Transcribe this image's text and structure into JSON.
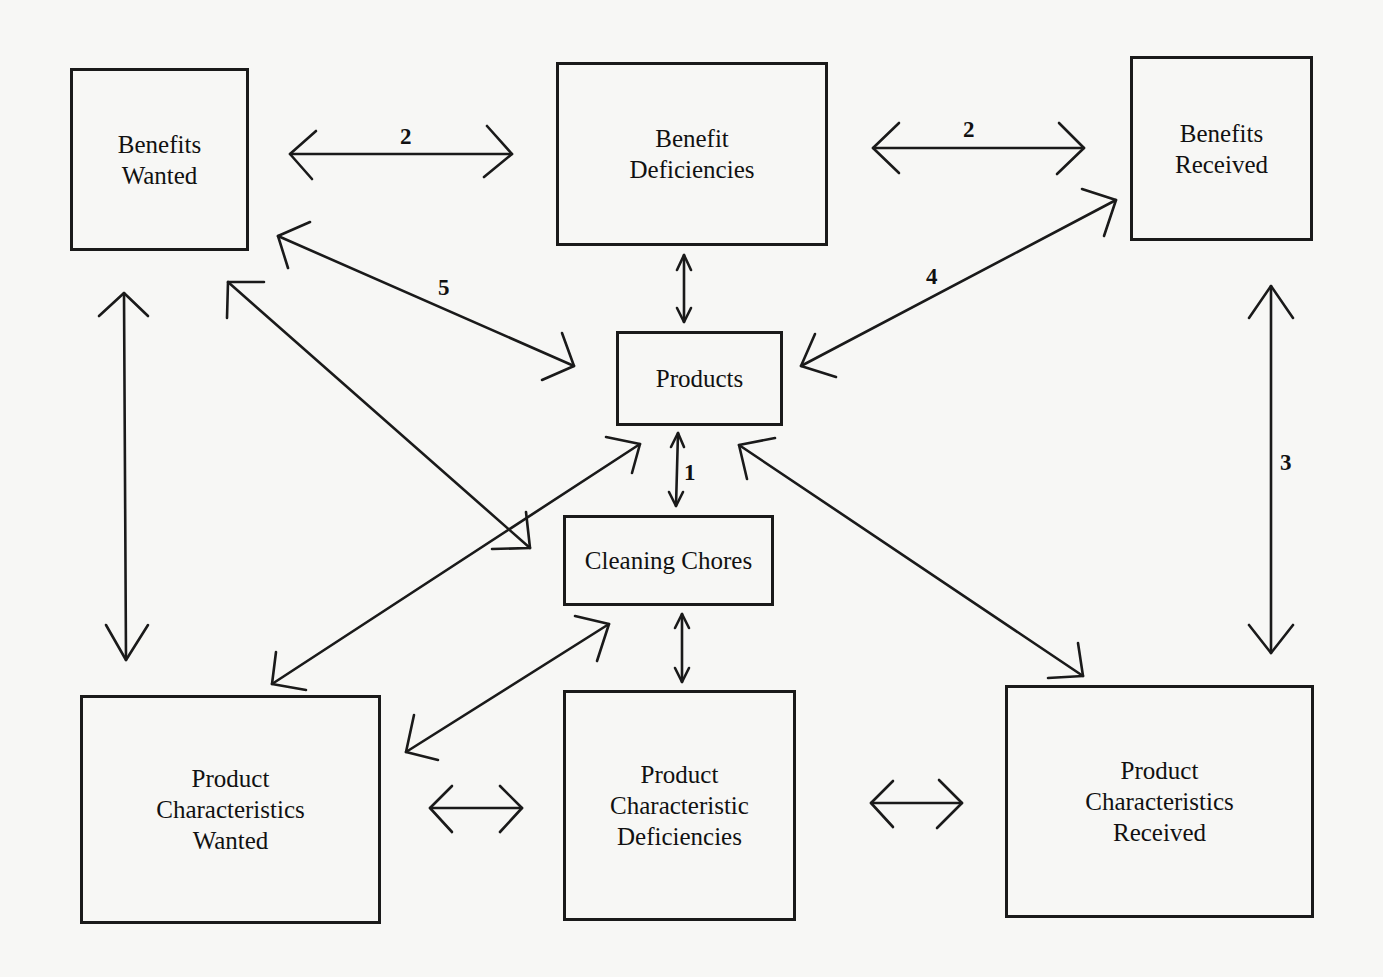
{
  "diagram": {
    "nodes": [
      {
        "id": "benefits_wanted",
        "label": "Benefits\nWanted"
      },
      {
        "id": "benefit_deficiencies",
        "label": "Benefit\nDeficiencies"
      },
      {
        "id": "benefits_received",
        "label": "Benefits\nReceived"
      },
      {
        "id": "products",
        "label": "Products"
      },
      {
        "id": "cleaning_chores",
        "label": "Cleaning Chores"
      },
      {
        "id": "product_characteristics_wanted",
        "label": "Product\nCharacteristics\nWanted"
      },
      {
        "id": "product_characteristic_deficiencies",
        "label": "Product\nCharacteristic\nDeficiencies"
      },
      {
        "id": "product_characteristics_received",
        "label": "Product\nCharacteristics\nReceived"
      }
    ],
    "edges": [
      {
        "from": "benefits_wanted",
        "to": "benefit_deficiencies",
        "label": "2",
        "bidirectional": true
      },
      {
        "from": "benefit_deficiencies",
        "to": "benefits_received",
        "label": "2",
        "bidirectional": true
      },
      {
        "from": "benefit_deficiencies",
        "to": "products",
        "label": "",
        "bidirectional": true
      },
      {
        "from": "benefits_wanted",
        "to": "products",
        "label": "5",
        "bidirectional": true
      },
      {
        "from": "benefits_received",
        "to": "products",
        "label": "4",
        "bidirectional": true
      },
      {
        "from": "products",
        "to": "cleaning_chores",
        "label": "1",
        "bidirectional": true
      },
      {
        "from": "benefits_wanted",
        "to": "product_characteristics_wanted",
        "label": "",
        "bidirectional": true
      },
      {
        "from": "benefits_received",
        "to": "product_characteristics_received",
        "label": "3",
        "bidirectional": true
      },
      {
        "from": "benefits_wanted",
        "to": "cleaning_chores",
        "label": "",
        "bidirectional": true
      },
      {
        "from": "products",
        "to": "product_characteristics_wanted",
        "label": "",
        "bidirectional": true
      },
      {
        "from": "products",
        "to": "product_characteristics_received",
        "label": "",
        "bidirectional": true
      },
      {
        "from": "cleaning_chores",
        "to": "product_characteristics_wanted",
        "label": "",
        "bidirectional": true
      },
      {
        "from": "cleaning_chores",
        "to": "product_characteristic_deficiencies",
        "label": "",
        "bidirectional": true
      },
      {
        "from": "product_characteristics_wanted",
        "to": "product_characteristic_deficiencies",
        "label": "",
        "bidirectional": true
      },
      {
        "from": "product_characteristic_deficiencies",
        "to": "product_characteristics_received",
        "label": "",
        "bidirectional": true
      }
    ],
    "edge_labels": {
      "bw_bd": "2",
      "bd_br": "2",
      "bw_products": "5",
      "br_products": "4",
      "products_chores": "1",
      "br_pcr": "3"
    }
  }
}
